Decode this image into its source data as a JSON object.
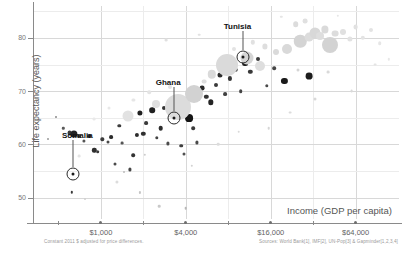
{
  "chart_data": {
    "type": "scatter",
    "title": "",
    "xlabel": "Income (GDP per capita)",
    "ylabel": "Life expectancy (years)",
    "xscale": "log",
    "xlim": [
      330,
      130000
    ],
    "ylim": [
      46,
      86
    ],
    "xticks": [
      1000,
      4000,
      16000,
      64000
    ],
    "xtick_labels": [
      "$1,000",
      "$4,000",
      "$16,000",
      "$64,000"
    ],
    "yticks": [
      50,
      60,
      70,
      80
    ],
    "ytick_labels": [
      "50",
      "60",
      "70",
      "80"
    ],
    "grid": true,
    "legend": "none",
    "note": "Bubble area encodes population; darker bubbles are lower income / lower life expectancy countries.",
    "annotations": [
      {
        "label": "Somalia",
        "x": 630,
        "y": 54.5,
        "label_x": 680,
        "label_y": 62.5
      },
      {
        "label": "Ghana",
        "x": 3300,
        "y": 65.0,
        "label_x": 3000,
        "label_y": 72.5
      },
      {
        "label": "Tunisia",
        "x": 10200,
        "y": 76.5,
        "label_x": 9300,
        "label_y": 83.0
      }
    ],
    "points": [
      {
        "x": 600,
        "y": 62.2,
        "r": 2.4,
        "c": "#3b3b3b"
      },
      {
        "x": 640,
        "y": 62.0,
        "r": 3.6,
        "c": "#222222"
      },
      {
        "x": 700,
        "y": 61.6,
        "r": 2.0,
        "c": "#444444"
      },
      {
        "x": 760,
        "y": 60.6,
        "r": 1.6,
        "c": "#555555"
      },
      {
        "x": 830,
        "y": 61.5,
        "r": 1.9,
        "c": "#333333"
      },
      {
        "x": 900,
        "y": 58.9,
        "r": 2.2,
        "c": "#2e2e2e"
      },
      {
        "x": 950,
        "y": 58.6,
        "r": 1.8,
        "c": "#3a3a3a"
      },
      {
        "x": 1020,
        "y": 61.0,
        "r": 1.7,
        "c": "#3c3c3c"
      },
      {
        "x": 1120,
        "y": 60.5,
        "r": 1.5,
        "c": "#484848"
      },
      {
        "x": 1180,
        "y": 61.4,
        "r": 1.9,
        "c": "#2b2b2b"
      },
      {
        "x": 1250,
        "y": 56.4,
        "r": 1.5,
        "c": "#4a4a4a"
      },
      {
        "x": 1350,
        "y": 63.5,
        "r": 1.7,
        "c": "#3d3d3d"
      },
      {
        "x": 1420,
        "y": 60.3,
        "r": 1.4,
        "c": "#555555"
      },
      {
        "x": 1500,
        "y": 65.3,
        "r": 2.0,
        "c": "#2a2a2a"
      },
      {
        "x": 1600,
        "y": 55.3,
        "r": 1.6,
        "c": "#464646"
      },
      {
        "x": 1700,
        "y": 58.0,
        "r": 1.8,
        "c": "#333333"
      },
      {
        "x": 1800,
        "y": 61.8,
        "r": 2.1,
        "c": "#2c2c2c"
      },
      {
        "x": 1900,
        "y": 66.0,
        "r": 2.6,
        "c": "#1f1f1f"
      },
      {
        "x": 2000,
        "y": 62.0,
        "r": 2.2,
        "c": "#303030"
      },
      {
        "x": 2100,
        "y": 64.0,
        "r": 1.9,
        "c": "#3a3a3a"
      },
      {
        "x": 2300,
        "y": 66.4,
        "r": 2.8,
        "c": "#202020"
      },
      {
        "x": 2500,
        "y": 61.2,
        "r": 1.7,
        "c": "#444444"
      },
      {
        "x": 2650,
        "y": 63.0,
        "r": 2.3,
        "c": "#2e2e2e"
      },
      {
        "x": 2800,
        "y": 66.9,
        "r": 2.0,
        "c": "#353535"
      },
      {
        "x": 3000,
        "y": 60.2,
        "r": 1.6,
        "c": "#4c4c4c"
      },
      {
        "x": 3200,
        "y": 65.6,
        "r": 2.1,
        "c": "#2a2a2a"
      },
      {
        "x": 3400,
        "y": 67.3,
        "r": 3.0,
        "c": "#1c1c1c"
      },
      {
        "x": 3700,
        "y": 59.8,
        "r": 1.8,
        "c": "#3f3f3f"
      },
      {
        "x": 3900,
        "y": 58.2,
        "r": 1.5,
        "c": "#505050"
      },
      {
        "x": 4200,
        "y": 65.0,
        "r": 3.9,
        "c": "#151515"
      },
      {
        "x": 4500,
        "y": 63.0,
        "r": 1.8,
        "c": "#3b3b3b"
      },
      {
        "x": 4800,
        "y": 60.4,
        "r": 1.6,
        "c": "#4a4a4a"
      },
      {
        "x": 5200,
        "y": 70.6,
        "r": 2.4,
        "c": "#2a2a2a"
      },
      {
        "x": 5600,
        "y": 69.0,
        "r": 2.2,
        "c": "#333333"
      },
      {
        "x": 6000,
        "y": 67.9,
        "r": 2.7,
        "c": "#242424"
      },
      {
        "x": 6500,
        "y": 71.2,
        "r": 2.0,
        "c": "#3a3a3a"
      },
      {
        "x": 7000,
        "y": 73.0,
        "r": 2.5,
        "c": "#2d2d2d"
      },
      {
        "x": 7600,
        "y": 69.5,
        "r": 1.9,
        "c": "#404040"
      },
      {
        "x": 8200,
        "y": 72.4,
        "r": 2.1,
        "c": "#363636"
      },
      {
        "x": 9000,
        "y": 74.0,
        "r": 2.3,
        "c": "#2e2e2e"
      },
      {
        "x": 9800,
        "y": 70.0,
        "r": 1.8,
        "c": "#444444"
      },
      {
        "x": 10500,
        "y": 75.2,
        "r": 2.9,
        "c": "#1e1e1e"
      },
      {
        "x": 11500,
        "y": 73.6,
        "r": 2.2,
        "c": "#383838"
      },
      {
        "x": 13000,
        "y": 76.0,
        "r": 2.0,
        "c": "#3c3c3c"
      },
      {
        "x": 15000,
        "y": 71.0,
        "r": 1.7,
        "c": "#4a4a4a"
      },
      {
        "x": 17000,
        "y": 74.3,
        "r": 1.8,
        "c": "#464646"
      },
      {
        "x": 20000,
        "y": 72.0,
        "r": 3.1,
        "c": "#1a1a1a"
      },
      {
        "x": 3500,
        "y": 67.0,
        "r": 13.0,
        "c": "#dcdcdc"
      },
      {
        "x": 4600,
        "y": 69.5,
        "r": 9.0,
        "c": "#d2d2d2"
      },
      {
        "x": 7900,
        "y": 75.0,
        "r": 11.0,
        "c": "#dadada"
      },
      {
        "x": 10800,
        "y": 76.2,
        "r": 6.5,
        "c": "#d5d5d5"
      },
      {
        "x": 13500,
        "y": 74.8,
        "r": 5.0,
        "c": "#dedede"
      },
      {
        "x": 1550,
        "y": 65.4,
        "r": 5.5,
        "c": "#e2e2e2"
      },
      {
        "x": 2450,
        "y": 67.6,
        "r": 4.0,
        "c": "#e0e0e0"
      },
      {
        "x": 6100,
        "y": 73.2,
        "r": 4.2,
        "c": "#dadada"
      },
      {
        "x": 21000,
        "y": 78.0,
        "r": 5.0,
        "c": "#d9d9d9"
      },
      {
        "x": 26000,
        "y": 79.4,
        "r": 6.2,
        "c": "#d4d4d4"
      },
      {
        "x": 30000,
        "y": 80.2,
        "r": 4.4,
        "c": "#dcdcdc"
      },
      {
        "x": 33000,
        "y": 81.0,
        "r": 5.5,
        "c": "#d8d8d8"
      },
      {
        "x": 36000,
        "y": 80.4,
        "r": 4.0,
        "c": "#dedede"
      },
      {
        "x": 39000,
        "y": 81.6,
        "r": 3.6,
        "c": "#dadada"
      },
      {
        "x": 42000,
        "y": 78.6,
        "r": 8.0,
        "c": "#d3d3d3"
      },
      {
        "x": 46000,
        "y": 80.8,
        "r": 3.4,
        "c": "#dddddd"
      },
      {
        "x": 52000,
        "y": 81.2,
        "r": 3.0,
        "c": "#e0e0e0"
      },
      {
        "x": 58000,
        "y": 79.8,
        "r": 2.6,
        "c": "#e2e2e2"
      },
      {
        "x": 64000,
        "y": 82.0,
        "r": 2.4,
        "c": "#e1e1e1"
      },
      {
        "x": 72000,
        "y": 80.0,
        "r": 2.2,
        "c": "#e4e4e4"
      },
      {
        "x": 82000,
        "y": 81.4,
        "r": 2.0,
        "c": "#e3e3e3"
      },
      {
        "x": 95000,
        "y": 79.0,
        "r": 1.8,
        "c": "#e6e6e6"
      },
      {
        "x": 24000,
        "y": 82.6,
        "r": 2.8,
        "c": "#dcdcdc"
      },
      {
        "x": 28000,
        "y": 83.2,
        "r": 2.4,
        "c": "#e0e0e0"
      },
      {
        "x": 17500,
        "y": 77.4,
        "r": 3.0,
        "c": "#dadada"
      },
      {
        "x": 14500,
        "y": 78.4,
        "r": 2.6,
        "c": "#dedede"
      },
      {
        "x": 12000,
        "y": 79.2,
        "r": 2.2,
        "c": "#e1e1e1"
      },
      {
        "x": 8800,
        "y": 78.0,
        "r": 2.0,
        "c": "#e3e3e3"
      },
      {
        "x": 5400,
        "y": 71.8,
        "r": 2.4,
        "c": "#dedede"
      },
      {
        "x": 3100,
        "y": 70.8,
        "r": 2.0,
        "c": "#e2e2e2"
      },
      {
        "x": 2200,
        "y": 69.8,
        "r": 1.8,
        "c": "#e4e4e4"
      },
      {
        "x": 1700,
        "y": 68.4,
        "r": 1.6,
        "c": "#e6e6e6"
      },
      {
        "x": 1150,
        "y": 66.8,
        "r": 1.5,
        "c": "#e8e8e8"
      },
      {
        "x": 900,
        "y": 64.8,
        "r": 1.4,
        "c": "#e9e9e9"
      },
      {
        "x": 700,
        "y": 57.8,
        "r": 1.4,
        "c": "#e4e4e4"
      },
      {
        "x": 1300,
        "y": 53.0,
        "r": 1.6,
        "c": "#dcdcdc"
      },
      {
        "x": 2600,
        "y": 48.4,
        "r": 1.3,
        "c": "#c9c9c9"
      },
      {
        "x": 4000,
        "y": 48.0,
        "r": 1.3,
        "c": "#b8b8b8"
      },
      {
        "x": 620,
        "y": 51.0,
        "r": 1.2,
        "c": "#3a3a3a"
      },
      {
        "x": 770,
        "y": 49.8,
        "r": 1.0,
        "c": "#cfcfcf"
      },
      {
        "x": 1900,
        "y": 51.0,
        "r": 1.1,
        "c": "#c5c5c5"
      },
      {
        "x": 1450,
        "y": 54.8,
        "r": 1.0,
        "c": "#bdbdbd"
      },
      {
        "x": 540,
        "y": 63.0,
        "r": 1.2,
        "c": "#5a5a5a"
      },
      {
        "x": 480,
        "y": 65.2,
        "r": 1.0,
        "c": "#8a8a8a"
      },
      {
        "x": 420,
        "y": 61.0,
        "r": 1.0,
        "c": "#9a9a9a"
      },
      {
        "x": 2900,
        "y": 79.6,
        "r": 1.4,
        "c": "#e0e0e0"
      },
      {
        "x": 5000,
        "y": 80.6,
        "r": 1.3,
        "c": "#e2e2e2"
      },
      {
        "x": 8000,
        "y": 82.4,
        "r": 1.2,
        "c": "#e4e4e4"
      },
      {
        "x": 19000,
        "y": 84.0,
        "r": 1.2,
        "c": "#e5e5e5"
      },
      {
        "x": 48000,
        "y": 84.2,
        "r": 1.2,
        "c": "#e6e6e6"
      },
      {
        "x": 88000,
        "y": 75.0,
        "r": 1.4,
        "c": "#e4e4e4"
      },
      {
        "x": 110000,
        "y": 76.0,
        "r": 1.2,
        "c": "#e8e8e8"
      },
      {
        "x": 60000,
        "y": 70.0,
        "r": 1.4,
        "c": "#dadada"
      },
      {
        "x": 33000,
        "y": 68.5,
        "r": 1.5,
        "c": "#d8d8d8"
      },
      {
        "x": 22000,
        "y": 66.0,
        "r": 1.4,
        "c": "#dcdcdc"
      },
      {
        "x": 15500,
        "y": 63.0,
        "r": 1.3,
        "c": "#d6d6d6"
      },
      {
        "x": 9500,
        "y": 62.4,
        "r": 1.3,
        "c": "#d9d9d9"
      },
      {
        "x": 6800,
        "y": 60.0,
        "r": 1.3,
        "c": "#dcdcdc"
      },
      {
        "x": 4400,
        "y": 56.0,
        "r": 1.2,
        "c": "#d2d2d2"
      },
      {
        "x": 2050,
        "y": 58.0,
        "r": 1.2,
        "c": "#cccccc"
      },
      {
        "x": 30000,
        "y": 72.8,
        "r": 3.4,
        "c": "#1d1d1d"
      },
      {
        "x": 25000,
        "y": 74.0,
        "r": 1.5,
        "c": "#d5d5d5"
      },
      {
        "x": 41000,
        "y": 73.6,
        "r": 1.4,
        "c": "#d9d9d9"
      }
    ]
  },
  "footnotes": {
    "left": "Constant 2011 $ adjusted for price differences.",
    "right": "Sources: World Bank[1], IMF[2], UN-Pop[3] & Gapminder[1,2,3,4]"
  }
}
